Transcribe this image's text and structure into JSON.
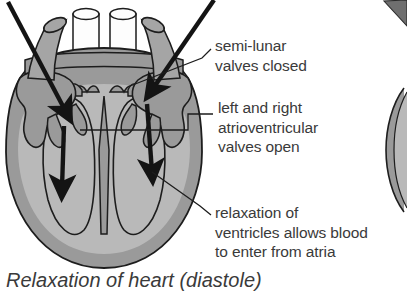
{
  "figure": {
    "caption": "Relaxation of heart (diastole)",
    "colors": {
      "heart_wall": "#9a9a9a",
      "chamber_fill": "#b9b9b9",
      "vessel_gray": "#a5a5a5",
      "vessel_white": "#fdfdfd",
      "outline": "#1d1d1d",
      "text": "#3a3a3a",
      "background": "#ffffff"
    },
    "labels": [
      {
        "id": "semi-lunar-valves",
        "lines": [
          "semi-lunar",
          "valves closed"
        ]
      },
      {
        "id": "atrioventricular-valves",
        "lines": [
          "left and right",
          "atrioventricular",
          "valves open"
        ]
      },
      {
        "id": "ventricle-relaxation",
        "lines": [
          "relaxation of",
          "ventricles allows blood",
          "to enter from atria"
        ]
      }
    ],
    "flow_arrows": [
      {
        "id": "inflow-left-vessel",
        "direction": "down-right"
      },
      {
        "id": "inflow-right-vessel",
        "direction": "down-left"
      },
      {
        "id": "blood-into-left-ventricle",
        "direction": "down"
      },
      {
        "id": "blood-into-right-ventricle",
        "direction": "down"
      }
    ]
  }
}
